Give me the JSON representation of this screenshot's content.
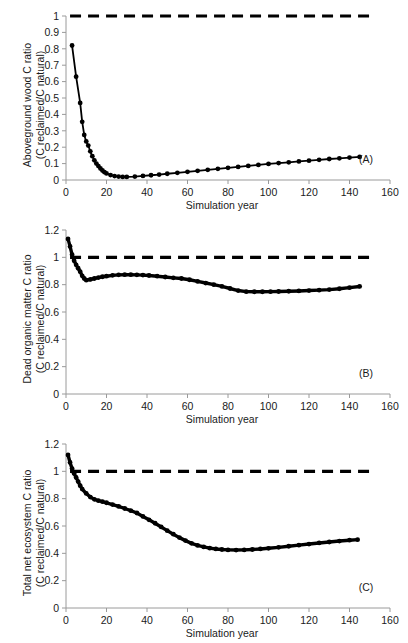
{
  "figure": {
    "panels": [
      {
        "tag": "(A)",
        "tag_name": "panel-a-tag",
        "ylabel_line1": "Aboveground wood C ratio",
        "ylabel_line2": "(C reclaimed/C natural)",
        "xlabel": "Simulation year"
      },
      {
        "tag": "(B)",
        "tag_name": "panel-b-tag",
        "ylabel_line1": "Dead organic matter C ratio",
        "ylabel_line2": "(C reclaimed/C natural)",
        "xlabel": "Simulation year"
      },
      {
        "tag": "(C)",
        "tag_name": "panel-c-tag",
        "ylabel_line1": "Total net ecosystem C ratio",
        "ylabel_line2": "(C reclaimed/C natural)",
        "xlabel": "Simulation year"
      }
    ]
  },
  "chart_data": [
    {
      "type": "line",
      "title": "",
      "panel": "A",
      "xlabel": "Simulation year",
      "ylabel": "Aboveground wood C ratio (C reclaimed/C natural)",
      "xlim": [
        0,
        160
      ],
      "ylim": [
        0,
        1
      ],
      "xticks": [
        0,
        20,
        40,
        60,
        80,
        100,
        120,
        140,
        160
      ],
      "yticks": [
        0,
        0.1,
        0.2,
        0.3,
        0.4,
        0.5,
        0.6,
        0.7,
        0.8,
        0.9,
        1
      ],
      "ytick_labels": [
        "0",
        "0.1",
        "0.2",
        "0.3",
        "0.4",
        "0.5",
        "0.6",
        "0.7",
        "0.8",
        "0.9",
        "1"
      ],
      "grid": false,
      "legend": "none",
      "series": [
        {
          "name": "Reference (natural) ratio = 1",
          "style": "dashed",
          "x": [
            2,
            150
          ],
          "values": [
            1,
            1
          ]
        },
        {
          "name": "Aboveground wood C ratio",
          "style": "solid-markers",
          "x": [
            3,
            5,
            7,
            8,
            9,
            10,
            11,
            12,
            13,
            14,
            15,
            16,
            17,
            18,
            19,
            20,
            22,
            24,
            26,
            28,
            30,
            34,
            38,
            42,
            46,
            50,
            55,
            60,
            65,
            70,
            75,
            80,
            85,
            90,
            95,
            100,
            105,
            110,
            115,
            120,
            125,
            130,
            135,
            140,
            145
          ],
          "values": [
            0.82,
            0.63,
            0.47,
            0.355,
            0.275,
            0.235,
            0.21,
            0.175,
            0.145,
            0.12,
            0.1,
            0.085,
            0.07,
            0.058,
            0.048,
            0.04,
            0.03,
            0.024,
            0.021,
            0.019,
            0.019,
            0.021,
            0.025,
            0.029,
            0.033,
            0.038,
            0.044,
            0.05,
            0.056,
            0.062,
            0.068,
            0.074,
            0.08,
            0.086,
            0.092,
            0.098,
            0.103,
            0.108,
            0.113,
            0.118,
            0.123,
            0.128,
            0.132,
            0.137,
            0.141
          ]
        }
      ]
    },
    {
      "type": "line",
      "title": "",
      "panel": "B",
      "xlabel": "Simulation year",
      "ylabel": "Dead organic matter C ratio (C reclaimed/C natural)",
      "xlim": [
        0,
        160
      ],
      "ylim": [
        0,
        1.2
      ],
      "xticks": [
        0,
        20,
        40,
        60,
        80,
        100,
        120,
        140,
        160
      ],
      "yticks": [
        0,
        0.2,
        0.4,
        0.6,
        0.8,
        1,
        1.2
      ],
      "ytick_labels": [
        "0",
        "0.2",
        "0.4",
        "0.6",
        "0.8",
        "1",
        "1.2"
      ],
      "grid": false,
      "legend": "none",
      "series": [
        {
          "name": "Reference (natural) ratio = 1",
          "style": "dashed",
          "x": [
            2,
            150
          ],
          "values": [
            1,
            1
          ]
        },
        {
          "name": "Dead organic matter C ratio",
          "style": "solid-markers",
          "x": [
            1,
            2,
            3,
            4,
            5,
            6,
            7,
            8,
            9,
            10,
            12,
            14,
            16,
            18,
            20,
            23,
            26,
            29,
            32,
            35,
            38,
            41,
            45,
            49,
            53,
            57,
            61,
            65,
            69,
            73,
            77,
            81,
            85,
            89,
            93,
            97,
            101,
            105,
            110,
            115,
            120,
            125,
            130,
            135,
            140,
            145
          ],
          "values": [
            1.135,
            1.08,
            1.02,
            0.975,
            0.945,
            0.92,
            0.895,
            0.865,
            0.845,
            0.833,
            0.838,
            0.845,
            0.852,
            0.858,
            0.862,
            0.868,
            0.872,
            0.873,
            0.873,
            0.872,
            0.87,
            0.867,
            0.862,
            0.856,
            0.85,
            0.845,
            0.836,
            0.824,
            0.812,
            0.8,
            0.787,
            0.772,
            0.757,
            0.749,
            0.748,
            0.748,
            0.749,
            0.75,
            0.752,
            0.754,
            0.757,
            0.76,
            0.764,
            0.77,
            0.778,
            0.787
          ]
        }
      ]
    },
    {
      "type": "line",
      "title": "",
      "panel": "C",
      "xlabel": "Simulation year",
      "ylabel": "Total net ecosystem C ratio (C reclaimed/C natural)",
      "xlim": [
        0,
        160
      ],
      "ylim": [
        0,
        1.2
      ],
      "xticks": [
        0,
        20,
        40,
        60,
        80,
        100,
        120,
        140,
        160
      ],
      "yticks": [
        0,
        0.2,
        0.4,
        0.6,
        0.8,
        1,
        1.2
      ],
      "ytick_labels": [
        "0",
        "0.2",
        "0.4",
        "0.6",
        "0.8",
        "1",
        "1.2"
      ],
      "grid": false,
      "legend": "none",
      "series": [
        {
          "name": "Reference (natural) ratio = 1",
          "style": "dashed",
          "x": [
            2,
            150
          ],
          "values": [
            1,
            1
          ]
        },
        {
          "name": "Total net ecosystem C ratio",
          "style": "solid-markers",
          "x": [
            1,
            2,
            3,
            4,
            5,
            6,
            7,
            8,
            10,
            12,
            14,
            16,
            18,
            20,
            23,
            26,
            29,
            32,
            35,
            38,
            41,
            44,
            47,
            50,
            53,
            56,
            59,
            62,
            65,
            68,
            71,
            74,
            77,
            80,
            84,
            88,
            92,
            96,
            100,
            105,
            110,
            115,
            120,
            125,
            130,
            135,
            140,
            144
          ],
          "values": [
            1.12,
            1.065,
            1.02,
            0.985,
            0.955,
            0.925,
            0.895,
            0.87,
            0.838,
            0.812,
            0.795,
            0.785,
            0.778,
            0.77,
            0.757,
            0.743,
            0.728,
            0.712,
            0.695,
            0.67,
            0.645,
            0.62,
            0.593,
            0.566,
            0.54,
            0.515,
            0.493,
            0.473,
            0.458,
            0.447,
            0.438,
            0.432,
            0.428,
            0.425,
            0.424,
            0.425,
            0.428,
            0.432,
            0.437,
            0.444,
            0.452,
            0.46,
            0.468,
            0.476,
            0.483,
            0.49,
            0.496,
            0.5
          ]
        }
      ]
    }
  ]
}
